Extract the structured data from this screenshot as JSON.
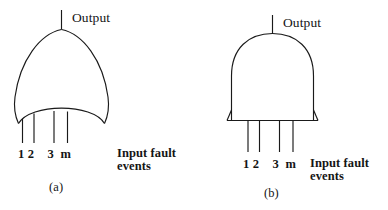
{
  "figure": {
    "background_color": "#ffffff",
    "stroke_color": "#1a1a1a",
    "text_color": "#151515"
  },
  "gates": [
    {
      "id": "gate-a",
      "type": "or-gate",
      "caption": "(a)",
      "output_label": "Output",
      "input_labels": "1 2    3  m",
      "annotation_line1": "Input fault",
      "annotation_line2": "events",
      "input_count": 4,
      "input_names": [
        "1",
        "2",
        "3",
        "m"
      ]
    },
    {
      "id": "gate-b",
      "type": "and-gate",
      "caption": "(b)",
      "output_label": "Output",
      "input_labels": "1 2    3  m",
      "annotation_line1": "Input fault",
      "annotation_line2": "events",
      "input_count": 4,
      "input_names": [
        "1",
        "2",
        "3",
        "m"
      ]
    }
  ]
}
